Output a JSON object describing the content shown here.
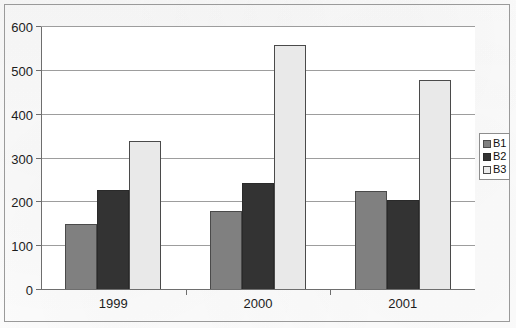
{
  "chart_data": {
    "type": "bar",
    "title": "",
    "subtitle": "",
    "xlabel": "",
    "ylabel": "",
    "categories": [
      "1999",
      "2000",
      "2001"
    ],
    "series": [
      {
        "name": "B1",
        "color": "#808080",
        "values": [
          150,
          180,
          225
        ]
      },
      {
        "name": "B2",
        "color": "#333333",
        "values": [
          228,
          245,
          205
        ]
      },
      {
        "name": "B3",
        "color": "#e9e9e9",
        "values": [
          340,
          560,
          478
        ]
      }
    ],
    "ylim": [
      0,
      600
    ],
    "ytick_step": 100,
    "yticks": [
      0,
      100,
      200,
      300,
      400,
      500,
      600
    ],
    "ytick_labels": [
      "0",
      "100",
      "200",
      "300",
      "400",
      "500",
      "600"
    ],
    "grid": true,
    "grid_axis": "y",
    "legend": true,
    "legend_position": "right",
    "legend_entries": [
      "B1",
      "B2",
      "B3"
    ],
    "bar_outline_color": "#4a4a4a",
    "frame": true,
    "annotations": []
  }
}
